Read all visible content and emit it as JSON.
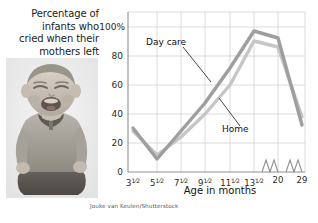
{
  "caption": {
    "lines": [
      "Percentage of",
      "infants who",
      "cried when their",
      "mothers left"
    ]
  },
  "photo": {
    "alt": "crying-infant-photo"
  },
  "credit": "Jouke van Keulen/Shutterstock",
  "axis_title_x": "Age in months",
  "series_labels": {
    "daycare": "Day care",
    "home": "Home"
  },
  "colors": {
    "daycare_line": "#9a9a9a",
    "home_line": "#c4c4c4",
    "grid": "#d0d0d0",
    "axis": "#8a8a8a",
    "text": "#1b1b1b"
  },
  "chart_data": {
    "type": "line",
    "title": "Percentage of infants who cried when their mothers left",
    "xlabel": "Age in months",
    "ylabel": "Percentage of infants who cried when their mothers left",
    "ylim": [
      0,
      100
    ],
    "ytick_labels": [
      "100%",
      "80",
      "60",
      "40",
      "20",
      "0"
    ],
    "ytick_values": [
      100,
      80,
      60,
      40,
      20,
      0
    ],
    "grid": true,
    "legend": "inline-annotations",
    "axis_break": true,
    "categories": [
      "3½",
      "5½",
      "7½",
      "9½",
      "11½",
      "13½",
      "20",
      "29"
    ],
    "x_tick_labels_html": [
      "3<sup>1/2</sup>",
      "5<sup>1/2</sup>",
      "7<sup>1/2</sup>",
      "9<sup>1/2</sup>",
      "11<sup>1/2</sup>",
      "13<sup>1/2</sup>",
      "20",
      "29"
    ],
    "series": [
      {
        "name": "Day care",
        "values": [
          30,
          9,
          28,
          48,
          72,
          97,
          88,
          32
        ]
      },
      {
        "name": "Home",
        "values": [
          28,
          12,
          24,
          40,
          60,
          90,
          86,
          38
        ]
      }
    ]
  }
}
